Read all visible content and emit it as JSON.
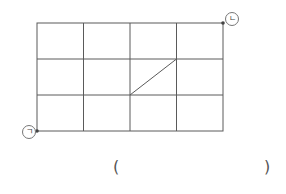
{
  "diagram": {
    "grid": {
      "columns": 4,
      "rows": 3,
      "left": 37,
      "top": 23,
      "right": 223,
      "bottom": 131,
      "line_color": "#555555"
    },
    "diagonal": {
      "from": {
        "x": 130,
        "y": 95
      },
      "to": {
        "x": 176,
        "y": 59
      }
    },
    "points": [
      {
        "id": "giyeok",
        "label": "ㄱ",
        "x": 37,
        "y": 131,
        "position": "bottom-left"
      },
      {
        "id": "nieun",
        "label": "ㄴ",
        "x": 223,
        "y": 23,
        "position": "top-right"
      }
    ],
    "answer": {
      "open": "(",
      "close": ")",
      "value": ""
    }
  }
}
